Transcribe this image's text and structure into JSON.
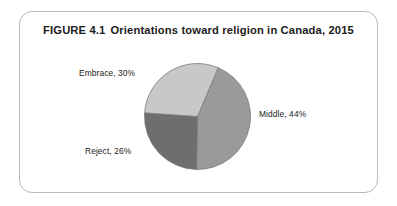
{
  "figure": {
    "number_label": "FIGURE 4.1",
    "title": "Orientations toward religion in Canada, 2015",
    "frame_border_color": "#b9b9b9",
    "background_color": "#ffffff",
    "text_color": "#1b1b1b"
  },
  "chart_data": {
    "type": "pie",
    "categories": [
      "Middle",
      "Embrace",
      "Reject"
    ],
    "values": [
      44,
      30,
      26
    ],
    "value_unit": "%",
    "labels": [
      "Middle, 44%",
      "Embrace, 30%",
      "Reject, 26%"
    ],
    "colors": [
      "#9a9a9a",
      "#c8c8c8",
      "#6e6e6e"
    ],
    "slice_border_color": "#7a7a7a",
    "legend": "none",
    "grid": false,
    "start_angle_deg": 23,
    "direction": "clockwise",
    "slices": [
      {
        "name": "Middle",
        "label": "Middle, 44%",
        "value": 44,
        "color": "#9a9a9a",
        "start_angle_deg": 23,
        "end_angle_deg": 181
      },
      {
        "name": "Reject",
        "label": "Reject, 26%",
        "value": 26,
        "color": "#6e6e6e",
        "start_angle_deg": 181,
        "end_angle_deg": 274
      },
      {
        "name": "Embrace",
        "label": "Embrace, 30%",
        "value": 30,
        "color": "#c8c8c8",
        "start_angle_deg": 274,
        "end_angle_deg": 383
      }
    ]
  }
}
